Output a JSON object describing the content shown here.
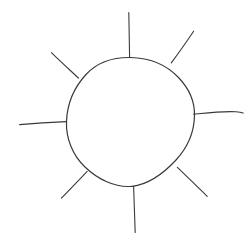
{
  "document": {
    "title": "Sun Sketch",
    "kind": "hand-drawn line drawing",
    "subject": "sun",
    "background_color": "#ffffff",
    "ink_color": "#3a3a3a",
    "canvas": {
      "width": 250,
      "height": 248
    }
  },
  "drawing": {
    "label": "sun-drawing",
    "stroke_count": 9,
    "sun_body": {
      "label": "sun-disc",
      "shape": "circle",
      "center": {
        "x": 130,
        "y": 121
      },
      "radius_x": 64,
      "radius_y": 64,
      "path": "M 130.5 57.5 C 150 57.8 167 65.5 178.5 77.5 C 189.5 89 194.8 102 194.5 115.5 C 194.2 131 188 147 176 160 C 163.5 173.5 148 184.5 132 186.3 C 115 188 97.5 179 85 167 C 72.5 155 65.8 138 66.5 121.5 C 67.2 104 74.5 87 86 74.5 C 97.5 62 113 57.2 130.5 57.5 Z"
    },
    "rays": [
      {
        "label": "ray-north",
        "direction": "up",
        "start": {
          "x": 129.5,
          "y": 57
        },
        "end": {
          "x": 129,
          "y": 12
        },
        "path": "M 129.6 57.2 C 129.3 45 129.0 30 128.8 12.5"
      },
      {
        "label": "ray-northeast",
        "direction": "up-right",
        "start": {
          "x": 171.5,
          "y": 62.5
        },
        "end": {
          "x": 193.5,
          "y": 31
        },
        "path": "M 171.3 62.8 C 177.5 54.5 186 42.5 193.6 31.2"
      },
      {
        "label": "ray-east",
        "direction": "right",
        "start": {
          "x": 193.5,
          "y": 114
        },
        "end": {
          "x": 243,
          "y": 112.5
        },
        "path": "M 193.6 114.3 C 208 112.8 224 110.8 236 111.8 C 239.5 112.1 241.5 112.5 243.2 113.0"
      },
      {
        "label": "ray-southeast",
        "direction": "down-right",
        "start": {
          "x": 177.5,
          "y": 167.5
        },
        "end": {
          "x": 207,
          "y": 196
        },
        "path": "M 177.4 167.3 C 185 174.5 196 185.5 207.2 196.3"
      },
      {
        "label": "ray-south",
        "direction": "down",
        "start": {
          "x": 133.5,
          "y": 186
        },
        "end": {
          "x": 135,
          "y": 232
        },
        "path": "M 133.6 186.2 C 134.0 198 134.5 215 135.2 232.5"
      },
      {
        "label": "ray-southwest",
        "direction": "down-left",
        "start": {
          "x": 87,
          "y": 171.5
        },
        "end": {
          "x": 61.5,
          "y": 198
        },
        "path": "M 87.2 171.4 C 79.5 179.5 69.5 190 61.4 198.2"
      },
      {
        "label": "ray-west",
        "direction": "left",
        "start": {
          "x": 66.5,
          "y": 121.5
        },
        "end": {
          "x": 19.5,
          "y": 124.5
        },
        "path": "M 66.4 121.6 C 53 122.2 36 123.2 19.6 124.6"
      },
      {
        "label": "ray-northwest",
        "direction": "up-left",
        "start": {
          "x": 78.5,
          "y": 78
        },
        "end": {
          "x": 51.5,
          "y": 52.5
        },
        "path": "M 78.6 78.2 C 71.5 71.5 60.5 61.5 51.4 52.6"
      }
    ]
  }
}
